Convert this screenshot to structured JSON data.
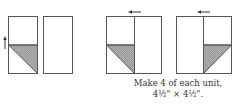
{
  "diagram": {
    "caption_line1": "Make 4 of each unit,",
    "caption_line2": "4½\" × 4½\".",
    "colors": {
      "stroke": "#555555",
      "shade": "#a8a8a8",
      "arrow": "#333333"
    },
    "units": [
      {
        "name": "strip-with-triangle",
        "arrow": "up"
      },
      {
        "name": "plain-strip"
      },
      {
        "name": "unit-a",
        "arrow": "left"
      },
      {
        "name": "unit-b",
        "arrow": "left"
      }
    ]
  }
}
